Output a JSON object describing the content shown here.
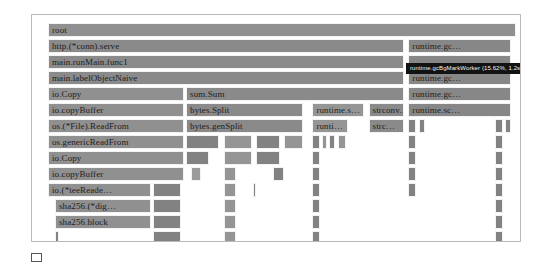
{
  "figure": {
    "title": "",
    "caption": ""
  },
  "tooltip": {
    "label": "runtime.gcBgMarkWorker (15.62%, 1.2s)",
    "visible": true
  },
  "chart_data": {
    "type": "flame-graph",
    "title": "",
    "xlabel": "",
    "ylabel": "",
    "grid": false,
    "legend": "none",
    "xlim": [
      0,
      100
    ],
    "units": "percent of samples",
    "depth_rows": 14,
    "row_height_px": 16,
    "hover": {
      "function": "runtime.gcBgMarkWorker",
      "percent": "15.62%",
      "duration": "1.2s"
    },
    "frames": [
      {
        "label": "root",
        "depth": 0,
        "x": 0.0,
        "w": 100.0,
        "shade": 1
      },
      {
        "label": "http.(*conn).serve",
        "depth": 1,
        "x": 0.0,
        "w": 76.0,
        "shade": 0
      },
      {
        "label": "runtime.gc…",
        "depth": 1,
        "x": 77.0,
        "w": 22.0,
        "shade": 2
      },
      {
        "label": "main.runMain.func1",
        "depth": 2,
        "x": 0.0,
        "w": 76.0,
        "shade": 0
      },
      {
        "label": "",
        "depth": 2,
        "x": 77.0,
        "w": 22.0,
        "shade": 2
      },
      {
        "label": "main.labelObjectNaive",
        "depth": 3,
        "x": 0.0,
        "w": 76.0,
        "shade": 0
      },
      {
        "label": "runtime.gc…",
        "depth": 3,
        "x": 77.0,
        "w": 22.0,
        "shade": 2
      },
      {
        "label": "io.Copy",
        "depth": 4,
        "x": 0.0,
        "w": 29.0,
        "shade": 1
      },
      {
        "label": "sum.Sum",
        "depth": 4,
        "x": 29.5,
        "w": 46.5,
        "shade": 0
      },
      {
        "label": "runtime.gc…",
        "depth": 4,
        "x": 77.0,
        "w": 22.0,
        "shade": 2
      },
      {
        "label": "io.copyBuffer",
        "depth": 5,
        "x": 0.0,
        "w": 29.0,
        "shade": 1
      },
      {
        "label": "bytes.Split",
        "depth": 5,
        "x": 29.5,
        "w": 25.0,
        "shade": 0
      },
      {
        "label": "runtime.s…",
        "depth": 5,
        "x": 56.5,
        "w": 11.0,
        "shade": 3
      },
      {
        "label": "strconv.…",
        "depth": 5,
        "x": 68.5,
        "w": 7.5,
        "shade": 0
      },
      {
        "label": "runtime.sc…",
        "depth": 5,
        "x": 77.0,
        "w": 22.0,
        "shade": 2
      },
      {
        "label": "os.(*File).ReadFrom",
        "depth": 6,
        "x": 0.0,
        "w": 29.0,
        "shade": 1
      },
      {
        "label": "bytes.genSplit",
        "depth": 6,
        "x": 29.5,
        "w": 25.0,
        "shade": 0
      },
      {
        "label": "runti…",
        "depth": 6,
        "x": 56.5,
        "w": 7.5,
        "shade": 3
      },
      {
        "label": "strc…",
        "depth": 6,
        "x": 68.5,
        "w": 7.5,
        "shade": 0
      },
      {
        "label": "",
        "depth": 6,
        "x": 77.0,
        "w": 1.6,
        "shade": 4
      },
      {
        "label": "",
        "depth": 6,
        "x": 79.2,
        "w": 1.4,
        "shade": 4
      },
      {
        "label": "",
        "depth": 6,
        "x": 95.6,
        "w": 1.6,
        "shade": 4
      },
      {
        "label": "",
        "depth": 6,
        "x": 97.6,
        "w": 1.4,
        "shade": 4
      },
      {
        "label": "os.genericReadFrom",
        "depth": 7,
        "x": 0.0,
        "w": 29.0,
        "shade": 1
      },
      {
        "label": "",
        "depth": 7,
        "x": 29.5,
        "w": 7.0,
        "shade": 4
      },
      {
        "label": "",
        "depth": 7,
        "x": 37.5,
        "w": 6.0,
        "shade": 3
      },
      {
        "label": "",
        "depth": 7,
        "x": 44.5,
        "w": 5.0,
        "shade": 4
      },
      {
        "label": "",
        "depth": 7,
        "x": 50.5,
        "w": 4.0,
        "shade": 3
      },
      {
        "label": "",
        "depth": 7,
        "x": 56.5,
        "w": 1.6,
        "shade": 4
      },
      {
        "label": "",
        "depth": 7,
        "x": 58.6,
        "w": 1.0,
        "shade": 3
      },
      {
        "label": "",
        "depth": 7,
        "x": 60.0,
        "w": 1.4,
        "shade": 4
      },
      {
        "label": "",
        "depth": 7,
        "x": 62.0,
        "w": 1.6,
        "shade": 3
      },
      {
        "label": "",
        "depth": 7,
        "x": 77.0,
        "w": 1.6,
        "shade": 4
      },
      {
        "label": "",
        "depth": 7,
        "x": 95.6,
        "w": 1.6,
        "shade": 4
      },
      {
        "label": "io.Copy",
        "depth": 8,
        "x": 0.0,
        "w": 29.0,
        "shade": 1
      },
      {
        "label": "",
        "depth": 8,
        "x": 29.5,
        "w": 5.0,
        "shade": 4
      },
      {
        "label": "",
        "depth": 8,
        "x": 37.5,
        "w": 6.0,
        "shade": 3
      },
      {
        "label": "",
        "depth": 8,
        "x": 44.5,
        "w": 5.0,
        "shade": 4
      },
      {
        "label": "",
        "depth": 8,
        "x": 56.5,
        "w": 1.6,
        "shade": 4
      },
      {
        "label": "",
        "depth": 8,
        "x": 77.0,
        "w": 1.6,
        "shade": 4
      },
      {
        "label": "",
        "depth": 8,
        "x": 95.6,
        "w": 1.6,
        "shade": 4
      },
      {
        "label": "io.copyBuffer",
        "depth": 9,
        "x": 0.0,
        "w": 29.0,
        "shade": 1
      },
      {
        "label": "",
        "depth": 9,
        "x": 30.5,
        "w": 2.2,
        "shade": 5
      },
      {
        "label": "",
        "depth": 9,
        "x": 37.5,
        "w": 2.6,
        "shade": 3
      },
      {
        "label": "",
        "depth": 9,
        "x": 48.0,
        "w": 2.4,
        "shade": 4
      },
      {
        "label": "",
        "depth": 9,
        "x": 56.5,
        "w": 1.6,
        "shade": 4
      },
      {
        "label": "",
        "depth": 9,
        "x": 77.0,
        "w": 1.6,
        "shade": 4
      },
      {
        "label": "",
        "depth": 9,
        "x": 95.6,
        "w": 1.6,
        "shade": 4
      },
      {
        "label": "io.(*teeReade…",
        "depth": 10,
        "x": 0.0,
        "w": 22.0,
        "shade": 1
      },
      {
        "label": "",
        "depth": 10,
        "x": 22.5,
        "w": 6.0,
        "shade": 4
      },
      {
        "label": "",
        "depth": 10,
        "x": 37.5,
        "w": 2.6,
        "shade": 3
      },
      {
        "label": "",
        "depth": 10,
        "x": 43.8,
        "w": 0.6,
        "shade": 4
      },
      {
        "label": "",
        "depth": 10,
        "x": 56.5,
        "w": 1.6,
        "shade": 4
      },
      {
        "label": "",
        "depth": 10,
        "x": 77.0,
        "w": 1.6,
        "shade": 4
      },
      {
        "label": "",
        "depth": 10,
        "x": 95.6,
        "w": 1.6,
        "shade": 4
      },
      {
        "label": "sha256.(*dig…",
        "depth": 11,
        "x": 1.5,
        "w": 20.5,
        "shade": 1
      },
      {
        "label": "",
        "depth": 11,
        "x": 22.5,
        "w": 6.0,
        "shade": 4
      },
      {
        "label": "",
        "depth": 11,
        "x": 37.5,
        "w": 2.6,
        "shade": 3
      },
      {
        "label": "",
        "depth": 11,
        "x": 56.5,
        "w": 1.6,
        "shade": 4
      },
      {
        "label": "",
        "depth": 11,
        "x": 95.6,
        "w": 1.6,
        "shade": 4
      },
      {
        "label": "sha256.block",
        "depth": 12,
        "x": 1.5,
        "w": 20.5,
        "shade": 1
      },
      {
        "label": "",
        "depth": 12,
        "x": 22.5,
        "w": 6.0,
        "shade": 4
      },
      {
        "label": "",
        "depth": 12,
        "x": 37.5,
        "w": 2.6,
        "shade": 3
      },
      {
        "label": "",
        "depth": 12,
        "x": 56.5,
        "w": 1.6,
        "shade": 4
      },
      {
        "label": "",
        "depth": 12,
        "x": 95.6,
        "w": 1.6,
        "shade": 4
      },
      {
        "label": "",
        "depth": 13,
        "x": 1.5,
        "w": 0.8,
        "shade": 4
      },
      {
        "label": "",
        "depth": 13,
        "x": 22.5,
        "w": 6.0,
        "shade": 4
      },
      {
        "label": "",
        "depth": 13,
        "x": 37.5,
        "w": 2.6,
        "shade": 3
      },
      {
        "label": "",
        "depth": 13,
        "x": 56.5,
        "w": 1.6,
        "shade": 4
      },
      {
        "label": "",
        "depth": 13,
        "x": 95.6,
        "w": 1.6,
        "shade": 4
      }
    ]
  },
  "colors": {
    "frame_fill": "#8d8d8d",
    "frame_border": "#f3f3f3",
    "panel_border": "#b9b9b9",
    "tooltip_bg": "#131313",
    "tooltip_text": "#f2f2f2",
    "page_bg": "#ffffff"
  }
}
